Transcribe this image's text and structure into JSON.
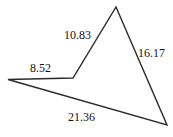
{
  "figure": {
    "type": "polygon",
    "shape_name": "concave-quadrilateral",
    "background_color": "#ffffff",
    "stroke_color": "#2b2b2b",
    "stroke_width": 1.4,
    "fill": "none",
    "canvas": {
      "width": 173,
      "height": 137
    },
    "vertices": [
      {
        "name": "left-vertex",
        "x": 8,
        "y": 79.5
      },
      {
        "name": "reflex-vertex",
        "x": 73,
        "y": 78
      },
      {
        "name": "apex-vertex",
        "x": 116,
        "y": 7
      },
      {
        "name": "bottom-right-vertex",
        "x": 167,
        "y": 125
      }
    ],
    "path": "M 8 79.5 L 73 78 L 116 7 L 167 125 Z",
    "edges": [
      {
        "name": "edge-left-horizontal",
        "from": "left-vertex",
        "to": "reflex-vertex",
        "label": "8.52",
        "label_position": "above"
      },
      {
        "name": "edge-upper-left-diagonal",
        "from": "reflex-vertex",
        "to": "apex-vertex",
        "label": "10.83",
        "label_position": "left"
      },
      {
        "name": "edge-right-diagonal",
        "from": "apex-vertex",
        "to": "bottom-right-vertex",
        "label": "16.17",
        "label_position": "right"
      },
      {
        "name": "edge-bottom-long",
        "from": "bottom-right-vertex",
        "to": "left-vertex",
        "label": "21.36",
        "label_position": "above"
      }
    ],
    "labels": {
      "side_a": "8.52",
      "side_b": "10.83",
      "side_c": "16.17",
      "side_d": "21.36"
    }
  }
}
